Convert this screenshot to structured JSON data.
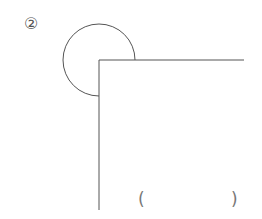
{
  "problem": {
    "number_label": "②",
    "answer_open": "(",
    "answer_close": ")"
  },
  "figure": {
    "stroke_color": "#555555",
    "angle_vertex": [
      99,
      60
    ],
    "horizontal_ray_end": [
      244,
      60
    ],
    "vertical_ray_end": [
      99,
      210
    ],
    "arc_radius": 36,
    "angle_type": "reflex angle (270°) marked by arc"
  }
}
